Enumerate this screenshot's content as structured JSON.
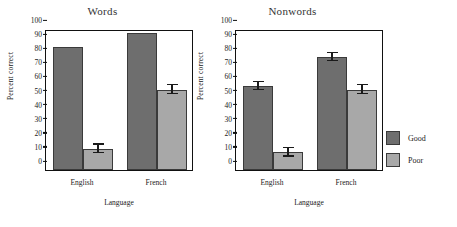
{
  "figure": {
    "background": "#ffffff",
    "good_color": "#6e6e6e",
    "poor_color": "#a8a8a8",
    "axis_color": "#111111"
  },
  "legend": {
    "position": "right",
    "items": [
      {
        "label": "Good",
        "color": "#6e6e6e"
      },
      {
        "label": "Poor",
        "color": "#a8a8a8"
      }
    ]
  },
  "axis": {
    "yticks": [
      "100",
      "90",
      "80",
      "70",
      "60",
      "50",
      "40",
      "30",
      "20",
      "10",
      "0"
    ],
    "ylabel": "Percent correct",
    "xlabel": "Language",
    "xticks": [
      "English",
      "French"
    ]
  },
  "chart_data": [
    {
      "type": "bar",
      "title": "Words",
      "xlabel": "Language",
      "ylabel": "Percent correct",
      "ylim": [
        0,
        100
      ],
      "ytick_step": 10,
      "grid": false,
      "legend_position": "right",
      "categories": [
        "English",
        "French"
      ],
      "series": [
        {
          "name": "Good",
          "color": "#6e6e6e",
          "values": [
            87,
            97
          ],
          "errors": [
            0,
            0
          ]
        },
        {
          "name": "Poor",
          "color": "#a8a8a8",
          "values": [
            15,
            57
          ],
          "errors": [
            3,
            3
          ]
        }
      ]
    },
    {
      "type": "bar",
      "title": "Nonwords",
      "xlabel": "Language",
      "ylabel": "Percent correct",
      "ylim": [
        0,
        100
      ],
      "ytick_step": 10,
      "grid": false,
      "legend_position": "right",
      "categories": [
        "English",
        "French"
      ],
      "series": [
        {
          "name": "Good",
          "color": "#6e6e6e",
          "values": [
            59.5,
            80
          ],
          "errors": [
            3,
            3
          ]
        },
        {
          "name": "Poor",
          "color": "#a8a8a8",
          "values": [
            12.5,
            57
          ],
          "errors": [
            3,
            3
          ]
        }
      ]
    }
  ]
}
